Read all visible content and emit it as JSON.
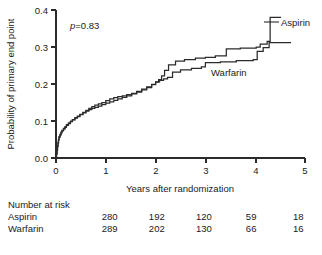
{
  "chart_data": {
    "type": "line",
    "title": "",
    "xlabel": "Years after randomization",
    "ylabel": "Probability of primary end point",
    "xlim": [
      0,
      5
    ],
    "ylim": [
      0,
      0.4
    ],
    "xticks": [
      "0",
      "1",
      "2",
      "3",
      "4",
      "5"
    ],
    "yticks": [
      "0.0",
      "0.1",
      "0.2",
      "0.3",
      "0.4"
    ],
    "grid": false,
    "legend_position": "inline-annotation",
    "annotations": [
      {
        "name": "p-value",
        "prefix": "p",
        "equals": "=",
        "value": "0.83",
        "x": 0.28,
        "y": 0.372
      }
    ],
    "series": [
      {
        "name": "Aspirin",
        "label_x": 4.48,
        "label_y": 0.375,
        "points": [
          [
            0.0,
            0.0
          ],
          [
            0.01,
            0.012
          ],
          [
            0.02,
            0.022
          ],
          [
            0.03,
            0.033
          ],
          [
            0.04,
            0.042
          ],
          [
            0.05,
            0.05
          ],
          [
            0.06,
            0.058
          ],
          [
            0.08,
            0.064
          ],
          [
            0.1,
            0.07
          ],
          [
            0.12,
            0.075
          ],
          [
            0.15,
            0.08
          ],
          [
            0.18,
            0.085
          ],
          [
            0.21,
            0.09
          ],
          [
            0.25,
            0.095
          ],
          [
            0.29,
            0.1
          ],
          [
            0.33,
            0.104
          ],
          [
            0.38,
            0.109
          ],
          [
            0.43,
            0.113
          ],
          [
            0.48,
            0.118
          ],
          [
            0.54,
            0.122
          ],
          [
            0.6,
            0.127
          ],
          [
            0.66,
            0.131
          ],
          [
            0.72,
            0.134
          ],
          [
            0.78,
            0.137
          ],
          [
            0.85,
            0.14
          ],
          [
            0.92,
            0.144
          ],
          [
            1.0,
            0.148
          ],
          [
            1.08,
            0.152
          ],
          [
            1.16,
            0.156
          ],
          [
            1.24,
            0.16
          ],
          [
            1.33,
            0.164
          ],
          [
            1.42,
            0.168
          ],
          [
            1.52,
            0.173
          ],
          [
            1.62,
            0.178
          ],
          [
            1.72,
            0.184
          ],
          [
            1.82,
            0.19
          ],
          [
            1.92,
            0.198
          ],
          [
            2.0,
            0.205
          ],
          [
            2.06,
            0.212
          ],
          [
            2.12,
            0.222
          ],
          [
            2.18,
            0.237
          ],
          [
            2.26,
            0.252
          ],
          [
            2.4,
            0.262
          ],
          [
            2.58,
            0.266
          ],
          [
            2.8,
            0.27
          ],
          [
            3.0,
            0.272
          ],
          [
            3.2,
            0.276
          ],
          [
            3.42,
            0.295
          ],
          [
            3.7,
            0.297
          ],
          [
            4.02,
            0.3
          ],
          [
            4.1,
            0.308
          ],
          [
            4.24,
            0.315
          ],
          [
            4.3,
            0.38
          ],
          [
            4.52,
            0.38
          ]
        ]
      },
      {
        "name": "Warfarin",
        "label_x": 3.18,
        "label_y": 0.228,
        "points": [
          [
            0.0,
            0.0
          ],
          [
            0.01,
            0.01
          ],
          [
            0.02,
            0.02
          ],
          [
            0.03,
            0.03
          ],
          [
            0.04,
            0.04
          ],
          [
            0.05,
            0.048
          ],
          [
            0.06,
            0.056
          ],
          [
            0.08,
            0.062
          ],
          [
            0.1,
            0.068
          ],
          [
            0.12,
            0.073
          ],
          [
            0.15,
            0.078
          ],
          [
            0.18,
            0.083
          ],
          [
            0.21,
            0.088
          ],
          [
            0.25,
            0.093
          ],
          [
            0.29,
            0.098
          ],
          [
            0.33,
            0.103
          ],
          [
            0.38,
            0.108
          ],
          [
            0.43,
            0.112
          ],
          [
            0.48,
            0.117
          ],
          [
            0.54,
            0.123
          ],
          [
            0.6,
            0.129
          ],
          [
            0.66,
            0.134
          ],
          [
            0.72,
            0.139
          ],
          [
            0.78,
            0.143
          ],
          [
            0.85,
            0.146
          ],
          [
            0.92,
            0.15
          ],
          [
            1.0,
            0.155
          ],
          [
            1.08,
            0.16
          ],
          [
            1.16,
            0.163
          ],
          [
            1.24,
            0.166
          ],
          [
            1.33,
            0.168
          ],
          [
            1.42,
            0.171
          ],
          [
            1.52,
            0.175
          ],
          [
            1.62,
            0.18
          ],
          [
            1.72,
            0.186
          ],
          [
            1.82,
            0.192
          ],
          [
            1.92,
            0.199
          ],
          [
            2.0,
            0.206
          ],
          [
            2.08,
            0.21
          ],
          [
            2.16,
            0.214
          ],
          [
            2.24,
            0.218
          ],
          [
            2.34,
            0.232
          ],
          [
            2.5,
            0.238
          ],
          [
            2.72,
            0.242
          ],
          [
            2.92,
            0.246
          ],
          [
            3.0,
            0.258
          ],
          [
            3.3,
            0.26
          ],
          [
            3.62,
            0.263
          ],
          [
            3.96,
            0.266
          ],
          [
            4.04,
            0.288
          ],
          [
            4.16,
            0.298
          ],
          [
            4.28,
            0.312
          ],
          [
            4.72,
            0.312
          ]
        ]
      }
    ]
  },
  "risk_table": {
    "title": "Number at risk",
    "rows": [
      {
        "label": "Aspirin",
        "values": [
          "280",
          "192",
          "120",
          "59",
          "18"
        ]
      },
      {
        "label": "Warfarin",
        "values": [
          "289",
          "202",
          "130",
          "66",
          "16"
        ]
      }
    ]
  },
  "colors": {
    "curve": "#2b2b2b",
    "axis": "#2b2b2b",
    "text": "#1a1a1a",
    "background": "#ffffff"
  }
}
